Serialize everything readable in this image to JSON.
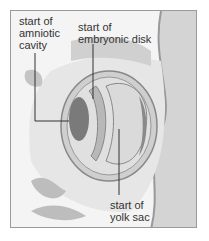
{
  "figure": {
    "labels": [
      {
        "id": "amniotic",
        "text": "start of\namniotic\ncavity"
      },
      {
        "id": "disk",
        "text": "start of\nembryonic disk"
      },
      {
        "id": "yolk",
        "text": "start of\nyolk sac"
      }
    ]
  },
  "colors": {
    "tissue": "#c8c8c8",
    "dark": "#7a7a7a",
    "cavity": "#dcdcdc",
    "wall": "#b0b0b0",
    "line": "#333333"
  }
}
